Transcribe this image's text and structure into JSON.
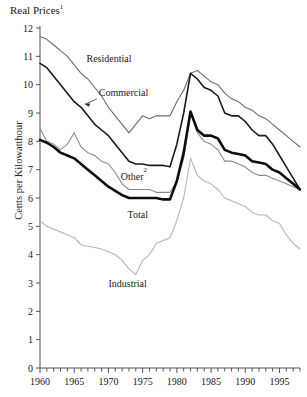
{
  "chart_data": {
    "type": "line",
    "title": "Real Prices",
    "title_superscript": "1",
    "xlabel": "",
    "ylabel": "Cents per Kilowatthour",
    "xlim": [
      1960,
      1998
    ],
    "ylim": [
      0,
      12
    ],
    "ytick_labels": [
      "0",
      "1",
      "2",
      "3",
      "4",
      "5",
      "6",
      "7",
      "8",
      "9",
      "10",
      "11",
      "12"
    ],
    "yticks": [
      0,
      1,
      2,
      3,
      4,
      5,
      6,
      7,
      8,
      9,
      10,
      11,
      12
    ],
    "xtick_labels": [
      "1960",
      "1965",
      "1970",
      "1975",
      "1980",
      "1985",
      "1990",
      "1995"
    ],
    "xticks": [
      1960,
      1965,
      1970,
      1975,
      1980,
      1985,
      1990,
      1995
    ],
    "minor_xtick_interval": 1,
    "grid": false,
    "legend_position": "inline-annotations",
    "x": [
      1960,
      1961,
      1962,
      1963,
      1964,
      1965,
      1966,
      1967,
      1968,
      1969,
      1970,
      1971,
      1972,
      1973,
      1974,
      1975,
      1976,
      1977,
      1978,
      1979,
      1980,
      1981,
      1982,
      1983,
      1984,
      1985,
      1986,
      1987,
      1988,
      1989,
      1990,
      1991,
      1992,
      1993,
      1994,
      1995,
      1996,
      1997,
      1998
    ],
    "series": [
      {
        "name": "Residential",
        "color": "#6b6b6b",
        "width": 1.1,
        "values": [
          11.7,
          11.6,
          11.4,
          11.2,
          11.0,
          10.7,
          10.4,
          10.2,
          9.9,
          9.6,
          9.2,
          8.9,
          8.6,
          8.3,
          8.6,
          8.9,
          8.8,
          8.9,
          8.9,
          8.9,
          9.4,
          9.8,
          10.4,
          10.5,
          10.3,
          10.1,
          10.0,
          9.7,
          9.5,
          9.4,
          9.2,
          9.1,
          8.9,
          8.8,
          8.6,
          8.4,
          8.2,
          8.0,
          7.8
        ]
      },
      {
        "name": "Commercial",
        "color": "#1a1a1a",
        "width": 1.6,
        "values": [
          10.75,
          10.6,
          10.3,
          10.0,
          9.7,
          9.4,
          9.2,
          8.9,
          8.6,
          8.4,
          8.2,
          7.9,
          7.6,
          7.3,
          7.2,
          7.2,
          7.15,
          7.15,
          7.15,
          7.1,
          7.9,
          9.0,
          10.4,
          10.2,
          9.9,
          9.8,
          9.6,
          9.0,
          8.9,
          8.9,
          8.7,
          8.4,
          8.2,
          8.2,
          7.9,
          7.5,
          7.1,
          6.7,
          6.3
        ]
      },
      {
        "name": "Other",
        "name_superscript": "2",
        "color": "#8a8a8a",
        "width": 1.1,
        "values": [
          8.45,
          8.0,
          7.9,
          7.7,
          7.9,
          8.3,
          7.8,
          7.6,
          7.5,
          7.3,
          7.2,
          6.9,
          6.5,
          6.3,
          6.3,
          6.3,
          6.3,
          6.2,
          6.2,
          6.2,
          6.6,
          7.4,
          9.0,
          8.3,
          8.0,
          7.9,
          7.7,
          7.3,
          7.3,
          7.2,
          7.1,
          6.9,
          6.8,
          6.8,
          6.7,
          6.6,
          6.5,
          6.4,
          6.3
        ]
      },
      {
        "name": "Total",
        "color": "#0d0d0d",
        "width": 2.6,
        "values": [
          8.05,
          7.95,
          7.8,
          7.6,
          7.5,
          7.4,
          7.2,
          7.0,
          6.8,
          6.6,
          6.4,
          6.25,
          6.1,
          6.0,
          6.0,
          6.0,
          6.0,
          6.0,
          5.95,
          5.95,
          6.6,
          7.6,
          9.05,
          8.4,
          8.2,
          8.2,
          8.1,
          7.7,
          7.6,
          7.55,
          7.5,
          7.3,
          7.25,
          7.2,
          7.0,
          6.9,
          6.7,
          6.5,
          6.3
        ]
      },
      {
        "name": "Industrial",
        "color": "#b6b6b6",
        "width": 1.1,
        "values": [
          5.2,
          5.0,
          4.9,
          4.8,
          4.7,
          4.6,
          4.35,
          4.3,
          4.25,
          4.2,
          4.1,
          4.0,
          3.8,
          3.5,
          3.3,
          3.8,
          4.0,
          4.4,
          4.5,
          4.6,
          5.2,
          6.0,
          7.4,
          6.8,
          6.6,
          6.5,
          6.3,
          6.0,
          5.9,
          5.8,
          5.7,
          5.5,
          5.4,
          5.4,
          5.2,
          5.1,
          4.7,
          4.4,
          4.2
        ]
      }
    ],
    "annotations": [
      {
        "name": "Residential",
        "text": "Residential",
        "x": 1966.8,
        "y": 10.8
      },
      {
        "name": "Commercial",
        "text": "Commercial",
        "x": 1968.6,
        "y": 9.6,
        "has_leader": true
      },
      {
        "name": "Other",
        "text": "Other",
        "superscript": "2",
        "x": 1971.8,
        "y": 6.65
      },
      {
        "name": "Total",
        "text": "Total",
        "x": 1972.8,
        "y": 5.3
      },
      {
        "name": "Industrial",
        "text": "Industrial",
        "x": 1970.0,
        "y": 2.85
      }
    ]
  }
}
